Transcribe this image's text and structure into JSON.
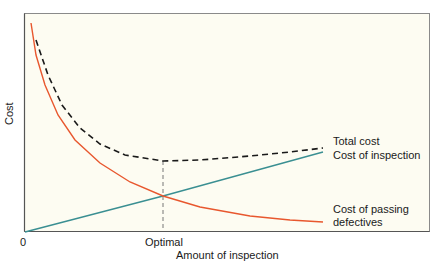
{
  "chart_data": {
    "type": "line",
    "title": "",
    "xlabel": "Amount of inspection",
    "ylabel": "Cost",
    "x_ticks": [
      "0",
      "Optimal"
    ],
    "grid": false,
    "legend": "inline labels at right end of curves",
    "series": [
      {
        "name": "Total cost",
        "style": "dashed",
        "color": "#1a1a1a",
        "points": [
          [
            36,
            40
          ],
          [
            48,
            75
          ],
          [
            62,
            105
          ],
          [
            80,
            128
          ],
          [
            100,
            144
          ],
          [
            125,
            155
          ],
          [
            163,
            161
          ],
          [
            200,
            160
          ],
          [
            250,
            156
          ],
          [
            290,
            152
          ],
          [
            323,
            148
          ]
        ]
      },
      {
        "name": "Cost of inspection",
        "style": "solid",
        "color": "#3a8f92",
        "points": [
          [
            25,
            232
          ],
          [
            163,
            196
          ],
          [
            323,
            152
          ]
        ]
      },
      {
        "name": "Cost of passing defectives",
        "style": "solid",
        "color": "#e8572e",
        "points": [
          [
            31,
            23
          ],
          [
            36,
            55
          ],
          [
            45,
            85
          ],
          [
            58,
            115
          ],
          [
            75,
            140
          ],
          [
            100,
            163
          ],
          [
            130,
            182
          ],
          [
            163,
            196
          ],
          [
            200,
            207
          ],
          [
            250,
            216
          ],
          [
            290,
            220
          ],
          [
            323,
            222
          ]
        ]
      }
    ],
    "annotations": [
      {
        "type": "vertical-dashed-line",
        "label": "Optimal",
        "at": "minimum of Total cost / intersection of cost curves"
      }
    ]
  },
  "labels": {
    "y_axis": "Cost",
    "x_axis": "Amount of inspection",
    "origin": "0",
    "optimal": "Optimal",
    "total_cost": "Total cost",
    "cost_inspection": "Cost of inspection",
    "cost_passing_1": "Cost of passing",
    "cost_passing_2": "defectives"
  },
  "colors": {
    "background": "#fdfcf2",
    "frame": "#8a8a8a",
    "total": "#1a1a1a",
    "inspection": "#3a8f92",
    "defectives": "#e8572e",
    "optimal_line": "#777777"
  }
}
